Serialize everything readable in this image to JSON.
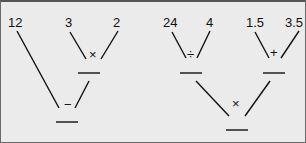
{
  "diagram": {
    "type": "expression-tree",
    "left_tree": {
      "leaves": [
        "12",
        "3",
        "2"
      ],
      "inner_op": "×",
      "root_op": "−"
    },
    "right_tree": {
      "left_leaves": [
        "24",
        "4"
      ],
      "left_op": "÷",
      "right_leaves": [
        "1.5",
        "3.5"
      ],
      "right_op": "+",
      "root_op": "×"
    }
  }
}
